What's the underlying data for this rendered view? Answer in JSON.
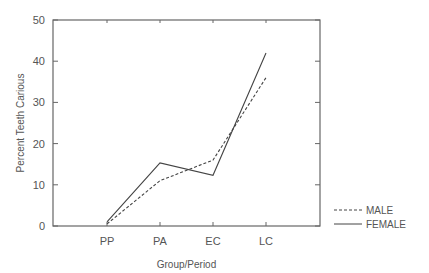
{
  "chart_data": {
    "type": "line",
    "title": "",
    "xlabel": "Group/Period",
    "ylabel": "Percent  Teeth  Carious",
    "categories": [
      "PP",
      "PA",
      "EC",
      "LC"
    ],
    "series": [
      {
        "name": "MALE",
        "style": "dashed",
        "values": [
          0.5,
          11,
          16,
          36
        ]
      },
      {
        "name": "FEMALE",
        "style": "solid",
        "values": [
          1,
          15.3,
          12.3,
          42
        ]
      }
    ],
    "ylim": [
      0,
      50
    ],
    "yticks": [
      0,
      10,
      20,
      30,
      40,
      50
    ],
    "grid": false,
    "legend_position": "right-bottom outside"
  }
}
